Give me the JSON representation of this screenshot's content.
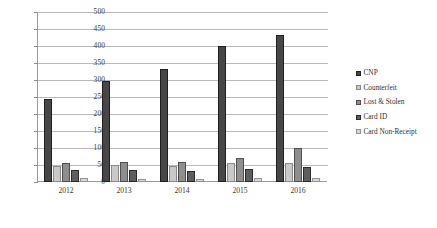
{
  "chart_data": {
    "type": "bar",
    "title": "",
    "xlabel": "",
    "ylabel": "",
    "ylim": [
      0,
      500
    ],
    "ystep": 50,
    "grid": true,
    "legend_position": "right",
    "categories": [
      "2012",
      "2013",
      "2014",
      "2015",
      "2016"
    ],
    "yticks": [
      "0",
      "50",
      "100",
      "150",
      "200",
      "250",
      "300",
      "350",
      "400",
      "450",
      "500"
    ],
    "series": [
      {
        "name": "CNP",
        "color": "#474747",
        "values": [
          243,
          298,
          331,
          401,
          432
        ]
      },
      {
        "name": "Counterfeit",
        "color": "#c9c9c9",
        "values": [
          46,
          50,
          47,
          55,
          56
        ]
      },
      {
        "name": "Lost & Stolen",
        "color": "#8e8e8e",
        "values": [
          57,
          58,
          59,
          72,
          100
        ]
      },
      {
        "name": "Card ID",
        "color": "#5e5e5e",
        "values": [
          35,
          36,
          31,
          38,
          45
        ]
      },
      {
        "name": "Card Non-Receipt",
        "color": "#d7d7d7",
        "values": [
          12,
          10,
          9,
          11,
          13
        ]
      }
    ]
  }
}
